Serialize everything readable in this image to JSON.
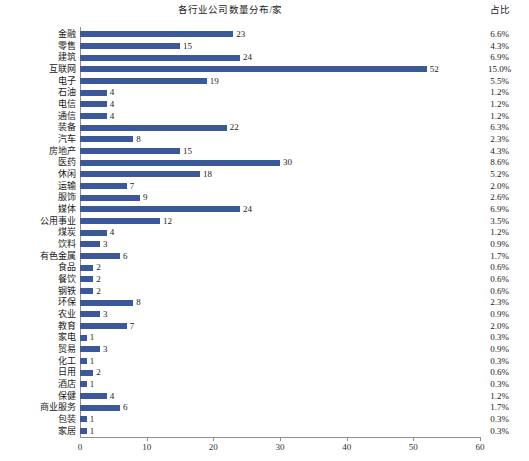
{
  "header": {
    "title": "各行业公司数量分布/家",
    "pct_column_header": "占比"
  },
  "axis": {
    "x_ticks": [
      "0",
      "10",
      "20",
      "30",
      "40",
      "50",
      "60"
    ],
    "x_min": 0,
    "x_max": 60,
    "x_step": 10
  },
  "chart_data": {
    "type": "bar",
    "orientation": "horizontal",
    "title": "各行业公司数量分布/家",
    "xlabel": "",
    "ylabel": "",
    "xlim": [
      0,
      60
    ],
    "grid": false,
    "legend": false,
    "bar_color": "#3b5998",
    "value_labels": true,
    "categories": [
      "金融",
      "零售",
      "建筑",
      "互联网",
      "电子",
      "石油",
      "电信",
      "通信",
      "装备",
      "汽车",
      "房地产",
      "医药",
      "休闲",
      "运输",
      "服饰",
      "媒体",
      "公用事业",
      "煤炭",
      "饮料",
      "有色金属",
      "食品",
      "餐饮",
      "钢铁",
      "环保",
      "农业",
      "教育",
      "家电",
      "贸易",
      "化工",
      "日用",
      "酒店",
      "保健",
      "商业服务",
      "包装",
      "家居"
    ],
    "values": [
      23,
      15,
      24,
      52,
      19,
      4,
      4,
      4,
      22,
      8,
      15,
      30,
      18,
      7,
      9,
      24,
      12,
      4,
      3,
      6,
      2,
      2,
      2,
      8,
      3,
      7,
      1,
      3,
      1,
      2,
      1,
      4,
      6,
      1,
      1
    ],
    "percentages": [
      "6.6%",
      "4.3%",
      "6.9%",
      "15.0%",
      "5.5%",
      "1.2%",
      "1.2%",
      "1.2%",
      "6.3%",
      "2.3%",
      "4.3%",
      "8.6%",
      "5.2%",
      "2.0%",
      "2.6%",
      "6.9%",
      "3.5%",
      "1.2%",
      "0.9%",
      "1.7%",
      "0.6%",
      "0.6%",
      "0.6%",
      "2.3%",
      "0.9%",
      "2.0%",
      "0.3%",
      "0.9%",
      "0.3%",
      "0.6%",
      "0.3%",
      "1.2%",
      "1.7%",
      "0.3%",
      "0.3%"
    ]
  }
}
